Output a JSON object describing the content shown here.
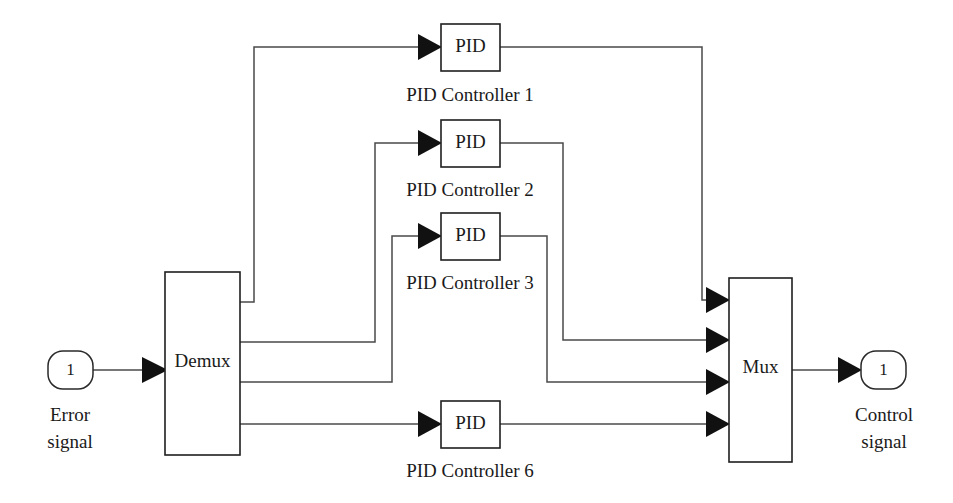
{
  "diagram": {
    "background_color": "#ffffff",
    "line_color": "#4a4a4a",
    "block_stroke_color": "#1f1f1f",
    "arrow_color": "#111111",
    "text_color": "#1a1a1a"
  },
  "input_port": {
    "number": "1",
    "caption_line1": "Error",
    "caption_line2": "signal"
  },
  "output_port": {
    "number": "1",
    "caption_line1": "Control",
    "caption_line2": "signal"
  },
  "demux": {
    "label": "Demux",
    "output_count": 4
  },
  "mux": {
    "label": "Mux",
    "input_count": 4
  },
  "controllers": [
    {
      "block_label": "PID",
      "caption": "PID Controller 1"
    },
    {
      "block_label": "PID",
      "caption": "PID Controller 2"
    },
    {
      "block_label": "PID",
      "caption": "PID Controller 3"
    },
    {
      "block_label": "PID",
      "caption": "PID Controller 6"
    }
  ]
}
